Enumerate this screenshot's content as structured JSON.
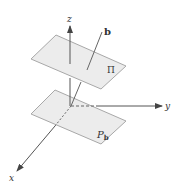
{
  "diagram": {
    "title": "",
    "colors": {
      "plane_fill": "#ececec",
      "plane_stroke": "#a8a8a8",
      "axis": "#555555",
      "line_b": "#666666",
      "text": "#333333"
    },
    "labels": {
      "z_axis": "z",
      "y_axis": "y",
      "x_axis": "x",
      "vector_b": "b",
      "plane_upper": "Π",
      "plane_lower_main": "P",
      "plane_lower_sub": "b"
    },
    "elements": [
      {
        "id": "plane-pi",
        "type": "parallelogram",
        "label": "Π",
        "corners": [
          [
            31,
            59
          ],
          [
            56,
            35
          ],
          [
            126,
            66
          ],
          [
            101,
            89
          ]
        ]
      },
      {
        "id": "plane-pb",
        "type": "parallelogram",
        "label": "P_b",
        "corners": [
          [
            31,
            114
          ],
          [
            55,
            90
          ],
          [
            126,
            121
          ],
          [
            101,
            144
          ]
        ]
      },
      {
        "id": "z-axis",
        "type": "arrow",
        "from": [
          70,
          105
        ],
        "to": [
          70,
          27
        ],
        "label": "z"
      },
      {
        "id": "y-axis",
        "type": "arrow",
        "from": [
          71,
          106
        ],
        "to": [
          162,
          106
        ],
        "label": "y",
        "dashed_segment": [
          [
            71,
            106
          ],
          [
            95,
            106
          ]
        ]
      },
      {
        "id": "x-axis",
        "type": "arrow",
        "from": [
          71,
          106
        ],
        "to": [
          17,
          171
        ],
        "label": "x",
        "dashed_segment": [
          [
            71,
            106
          ],
          [
            55,
            126
          ]
        ]
      },
      {
        "id": "line-b",
        "type": "line",
        "from": [
          71,
          106
        ],
        "to": [
          102,
          32
        ],
        "label": "b"
      }
    ]
  }
}
